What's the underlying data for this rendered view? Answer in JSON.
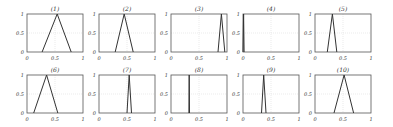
{
  "figure": {
    "layout": {
      "rows": 2,
      "cols": 5
    },
    "axis_ticks": {
      "x": [
        "0",
        "0.5",
        "1"
      ],
      "y": [
        "0",
        "0.5",
        "1"
      ]
    },
    "colors": {
      "line": "#333333",
      "axes": "#555555",
      "grid": "#dddddd"
    }
  },
  "chart_data": [
    {
      "type": "line",
      "title": "(1)",
      "x": [
        0.27,
        0.54,
        0.79
      ],
      "y": [
        0,
        1,
        0
      ],
      "xlim": [
        0,
        1
      ],
      "ylim": [
        0,
        1
      ],
      "grid": true,
      "xticks": [
        "0",
        "0.5",
        "1"
      ],
      "yticks": [
        "0",
        "0.5",
        "1"
      ]
    },
    {
      "type": "line",
      "title": "(2)",
      "x": [
        0.29,
        0.45,
        0.61
      ],
      "y": [
        0,
        1,
        0
      ],
      "xlim": [
        0,
        1
      ],
      "ylim": [
        0,
        1
      ],
      "grid": true,
      "xticks": [
        "0",
        "0.5",
        "1"
      ],
      "yticks": [
        "0",
        "0.5",
        "1"
      ]
    },
    {
      "type": "line",
      "title": "(3)",
      "x": [
        0.84,
        0.9,
        0.96
      ],
      "y": [
        0,
        1,
        0
      ],
      "xlim": [
        0,
        1
      ],
      "ylim": [
        0,
        1
      ],
      "grid": true,
      "xticks": [
        "0",
        "0.5",
        "1"
      ],
      "yticks": [
        "0",
        "0.5",
        "1"
      ]
    },
    {
      "type": "line",
      "title": "(4)",
      "x": [
        0.0,
        0.01,
        0.02
      ],
      "y": [
        0,
        1,
        0
      ],
      "xlim": [
        0,
        1
      ],
      "ylim": [
        0,
        1
      ],
      "grid": true,
      "xticks": [
        "0",
        "0.5",
        "1"
      ],
      "yticks": [
        "0",
        "0.5",
        "1"
      ]
    },
    {
      "type": "line",
      "title": "(5)",
      "x": [
        0.22,
        0.31,
        0.39
      ],
      "y": [
        0,
        1,
        0
      ],
      "xlim": [
        0,
        1
      ],
      "ylim": [
        0,
        1
      ],
      "grid": true,
      "xticks": [
        "0",
        "0.5",
        "1"
      ],
      "yticks": [
        "0",
        "0.5",
        "1"
      ]
    },
    {
      "type": "line",
      "title": "(6)",
      "x": [
        0.12,
        0.35,
        0.55
      ],
      "y": [
        0,
        1,
        0
      ],
      "xlim": [
        0,
        1
      ],
      "ylim": [
        0,
        1
      ],
      "grid": true,
      "xticks": [
        "0",
        "0.5",
        "1"
      ],
      "yticks": [
        "0",
        "0.5",
        "1"
      ]
    },
    {
      "type": "line",
      "title": "(7)",
      "x": [
        0.5,
        0.54,
        0.58
      ],
      "y": [
        0,
        1,
        0
      ],
      "xlim": [
        0,
        1
      ],
      "ylim": [
        0,
        1
      ],
      "grid": true,
      "xticks": [
        "0",
        "0.5",
        "1"
      ],
      "yticks": [
        "0",
        "0.5",
        "1"
      ]
    },
    {
      "type": "line",
      "title": "(8)",
      "x": [
        0.32,
        0.325,
        0.33
      ],
      "y": [
        0,
        1,
        0
      ],
      "xlim": [
        0,
        1
      ],
      "ylim": [
        0,
        1
      ],
      "grid": true,
      "xticks": [
        "0",
        "0.5",
        "1"
      ],
      "yticks": [
        "0",
        "0.5",
        "1"
      ]
    },
    {
      "type": "line",
      "title": "(9)",
      "x": [
        0.33,
        0.37,
        0.41
      ],
      "y": [
        0,
        1,
        0
      ],
      "xlim": [
        0,
        1
      ],
      "ylim": [
        0,
        1
      ],
      "grid": true,
      "xticks": [
        "0",
        "0.5",
        "1"
      ],
      "yticks": [
        "0",
        "0.5",
        "1"
      ]
    },
    {
      "type": "line",
      "title": "(10)",
      "x": [
        0.34,
        0.52,
        0.69
      ],
      "y": [
        0,
        1,
        0
      ],
      "xlim": [
        0,
        1
      ],
      "ylim": [
        0,
        1
      ],
      "grid": true,
      "xticks": [
        "0",
        "0.5",
        "1"
      ],
      "yticks": [
        "0",
        "0.5",
        "1"
      ]
    }
  ]
}
